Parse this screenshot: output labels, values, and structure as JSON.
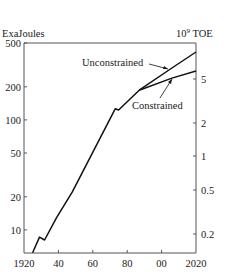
{
  "chart_data": {
    "type": "line",
    "title": "",
    "xlabel": "",
    "ylabel": "ExaJoules",
    "ylabel_right": "10⁹ TOE",
    "yscale": "log",
    "xlim": [
      1920,
      2020
    ],
    "ylim": [
      6.2,
      500
    ],
    "x_ticks": [
      "1920",
      "40",
      "60",
      "80",
      "00",
      "2020"
    ],
    "x_tick_values": [
      1920,
      1940,
      1960,
      1980,
      2000,
      2020
    ],
    "y_ticks_left": [
      "500",
      "200",
      "100",
      "50",
      "20",
      "10"
    ],
    "y_tick_values_left": [
      500,
      200,
      100,
      50,
      20,
      10
    ],
    "y_ticks_right": [
      "5",
      "2",
      "1",
      "0.5",
      "0.2"
    ],
    "y_tick_values_right_ej": [
      235,
      94,
      47,
      23.5,
      9.4
    ],
    "grid": false,
    "legend": "inline annotations",
    "series": [
      {
        "name": "Historical",
        "x": [
          1925,
          1929,
          1932,
          1939,
          1948,
          1973,
          1975,
          1987
        ],
        "values": [
          6.2,
          8.6,
          8.1,
          13,
          22,
          126,
          123,
          186
        ]
      },
      {
        "name": "Unconstrained",
        "x": [
          1987,
          2006,
          2020
        ],
        "values": [
          186,
          296,
          414
        ]
      },
      {
        "name": "Constrained",
        "x": [
          1987,
          2006,
          2020
        ],
        "values": [
          186,
          240,
          278
        ]
      }
    ],
    "annotations": [
      "Unconstrained",
      "Constrained"
    ]
  },
  "labels": {
    "left_axis_title": "ExaJoules",
    "right_axis_title_base": "10",
    "right_axis_title_exp": "9",
    "right_axis_title_unit": " TOE",
    "unconstrained": "Unconstrained",
    "constrained": "Constrained",
    "x": [
      "1920",
      "40",
      "60",
      "80",
      "00",
      "2020"
    ],
    "left": [
      "500",
      "200",
      "100",
      "50",
      "20",
      "10"
    ],
    "right": [
      "5",
      "2",
      "1",
      "0.5",
      "0.2"
    ]
  }
}
